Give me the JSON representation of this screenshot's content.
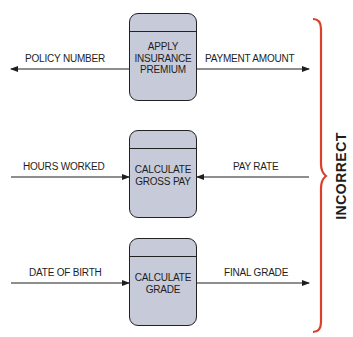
{
  "diagram": {
    "type": "data-flow-diagram-examples",
    "verdict_label": "INCORRECT",
    "colors": {
      "process_fill": "#c6cad9",
      "process_border": "#222222",
      "brace": "#d9412b",
      "text": "#1e1e1e"
    },
    "processes": [
      {
        "name": "APPLY\nINSURANCE\nPREMIUM",
        "left_flow": {
          "label": "POLICY NUMBER",
          "direction": "outgoing"
        },
        "right_flow": {
          "label": "PAYMENT AMOUNT",
          "direction": "outgoing"
        }
      },
      {
        "name": "CALCULATE\nGROSS PAY",
        "left_flow": {
          "label": "HOURS WORKED",
          "direction": "incoming"
        },
        "right_flow": {
          "label": "PAY RATE",
          "direction": "incoming"
        }
      },
      {
        "name": "CALCULATE\nGRADE",
        "left_flow": {
          "label": "DATE OF BIRTH",
          "direction": "incoming"
        },
        "right_flow": {
          "label": "FINAL GRADE",
          "direction": "outgoing"
        }
      }
    ]
  }
}
